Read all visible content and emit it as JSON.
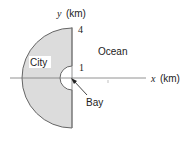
{
  "diagram": {
    "axes": {
      "x_var": "x",
      "x_unit": "(km)",
      "y_var": "y",
      "y_unit": "(km)"
    },
    "ticks": {
      "outer_radius": "4",
      "inner_radius": "1"
    },
    "regions": {
      "city": "City",
      "ocean": "Ocean",
      "bay": "Bay"
    },
    "colors": {
      "city_fill": "#dcdcdc",
      "stroke": "#666666",
      "axis": "#777777",
      "text": "#222222"
    }
  }
}
